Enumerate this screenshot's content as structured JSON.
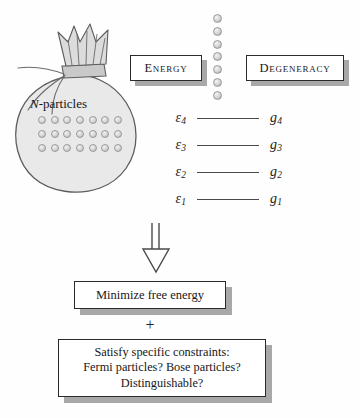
{
  "figure": {
    "type": "statistical-mechanics-flow-diagram",
    "background_color": "#fefefe",
    "ink_color": "#1c1c1c"
  },
  "bag": {
    "label_prefix": "N",
    "label_suffix": "-particles",
    "particle_rows": 3,
    "particle_columns": 7,
    "particle_total": 21,
    "fill_color": "#e9e9e9",
    "outline_color": "#5d5d5d"
  },
  "headers": {
    "energy": "Energy",
    "degeneracy": "Degeneracy"
  },
  "dot_column": {
    "count": 7,
    "dot_color": "#d2d2d2"
  },
  "levels": [
    {
      "energy": "ε",
      "energy_sub": "4",
      "degeneracy": "g",
      "degeneracy_sub": "4"
    },
    {
      "energy": "ε",
      "energy_sub": "3",
      "degeneracy": "g",
      "degeneracy_sub": "3"
    },
    {
      "energy": "ε",
      "energy_sub": "2",
      "degeneracy": "g",
      "degeneracy_sub": "2"
    },
    {
      "energy": "ε",
      "energy_sub": "1",
      "degeneracy": "g",
      "degeneracy_sub": "1"
    }
  ],
  "flow": {
    "arrow_direction": "down",
    "minimize_label": "Minimize free energy",
    "plus_label": "+",
    "constraints_line1": "Satisfy specific constraints:",
    "constraints_line2": "Fermi particles? Bose particles?",
    "constraints_line3": "Distinguishable?"
  },
  "style": {
    "box_border_color": "#2b2b2b",
    "box_shadow_color": "#a8a8a8",
    "level_line_color": "#4a4a4a"
  }
}
